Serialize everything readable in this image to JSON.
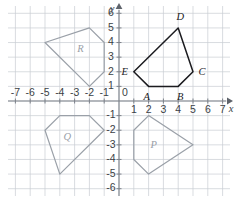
{
  "chart_data": {
    "type": "scatter",
    "title": "",
    "xlabel": "x",
    "ylabel": "y",
    "grid": true,
    "legend_position": "none",
    "xlim": [
      -7.5,
      7.5
    ],
    "ylim": [
      -6.5,
      6.5
    ],
    "x_ticks": [
      -7,
      -6,
      -5,
      -4,
      -3,
      -2,
      -1,
      0,
      1,
      2,
      3,
      4,
      5,
      6,
      7
    ],
    "y_ticks": [
      -6,
      -5,
      -4,
      -3,
      -2,
      -1,
      0,
      1,
      2,
      3,
      4,
      5,
      6
    ],
    "x_tick_labels": [
      "-7",
      "-6",
      "-5",
      "-4",
      "-3",
      "-2",
      "-1",
      "0",
      "1",
      "2",
      "3",
      "4",
      "5",
      "6",
      "7"
    ],
    "y_tick_labels": [
      "-6",
      "-5",
      "-4",
      "-3",
      "-2",
      "-1",
      "0",
      "1",
      "2",
      "3",
      "4",
      "5",
      "6"
    ],
    "origin_label": "0",
    "axis_labels": {
      "x": "x",
      "y": "y"
    },
    "shapes": [
      {
        "id": "ABCDE",
        "role": "preimage",
        "color": "#1b1b1f",
        "closed": true,
        "points": [
          [
            2,
            1
          ],
          [
            4,
            1
          ],
          [
            5,
            2
          ],
          [
            4,
            5
          ],
          [
            1,
            2
          ]
        ],
        "vertex_labels": [
          {
            "name": "A",
            "x": 2,
            "y": 1,
            "dx": -2,
            "dy": 11
          },
          {
            "name": "B",
            "x": 4,
            "y": 1,
            "dx": 2,
            "dy": 11
          },
          {
            "name": "C",
            "x": 5,
            "y": 2,
            "dx": 9,
            "dy": 1
          },
          {
            "name": "D",
            "x": 4,
            "y": 5,
            "dx": 2,
            "dy": -10
          },
          {
            "name": "E",
            "x": 1,
            "y": 2,
            "dx": -9,
            "dy": 1
          }
        ]
      },
      {
        "id": "P",
        "role": "image",
        "color": "#9aa0a8",
        "closed": true,
        "points": [
          [
            2,
            -1
          ],
          [
            5,
            -3
          ],
          [
            2,
            -5
          ],
          [
            1,
            -4
          ],
          [
            1,
            -2
          ]
        ],
        "label": "P",
        "label_x": 2.35,
        "label_y": -3.05
      },
      {
        "id": "Q",
        "role": "image",
        "color": "#9aa0a8",
        "closed": true,
        "points": [
          [
            -2,
            -1
          ],
          [
            -1,
            -2
          ],
          [
            -4,
            -5
          ],
          [
            -5,
            -2
          ],
          [
            -4,
            -1
          ]
        ],
        "label": "Q",
        "label_x": -3.5,
        "label_y": -2.5
      },
      {
        "id": "R",
        "role": "image",
        "color": "#9aa0a8",
        "closed": true,
        "points": [
          [
            -2,
            5
          ],
          [
            -1,
            4
          ],
          [
            -1,
            2
          ],
          [
            -2,
            1
          ],
          [
            -5,
            4
          ]
        ],
        "label": "R",
        "label_x": -2.6,
        "label_y": 3.5
      }
    ]
  },
  "figure": {
    "caption": ""
  }
}
